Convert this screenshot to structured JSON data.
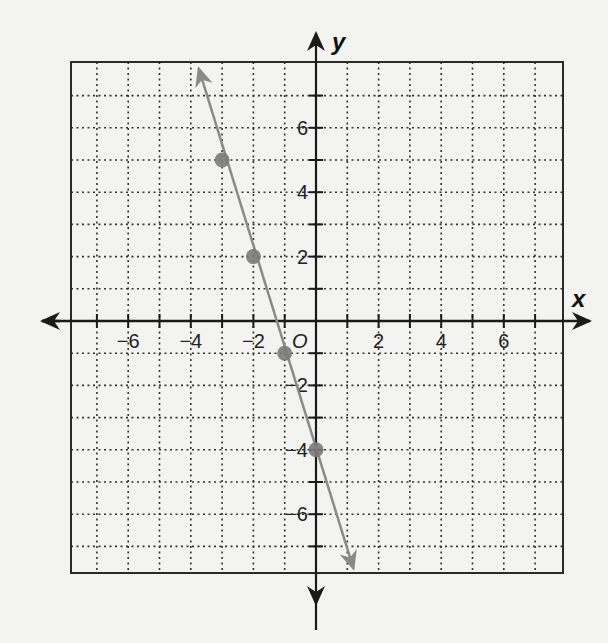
{
  "chart_data": {
    "type": "line",
    "title": "",
    "xlabel": "x",
    "ylabel": "y",
    "origin_label": "O",
    "xlim": [
      -7.5,
      7.5
    ],
    "ylim": [
      -7.9,
      8
    ],
    "grid": true,
    "grid_style": "dotted",
    "x_ticks": [
      -6,
      -4,
      -2,
      2,
      4,
      6
    ],
    "x_tick_labels": [
      "−6",
      "−4",
      "−2",
      "2",
      "4",
      "6"
    ],
    "y_ticks": [
      6,
      4,
      2,
      -2,
      -4,
      -6
    ],
    "y_tick_labels": [
      "6",
      "4",
      "2",
      "−2",
      "−4",
      "−6"
    ],
    "series": [
      {
        "name": "y = -3x - 4",
        "kind": "line-with-arrows",
        "color": "#8a8a8a",
        "endpoints": [
          [
            -3.75,
            7.85
          ],
          [
            1.2,
            -7.7
          ]
        ],
        "points": [
          [
            -3,
            5
          ],
          [
            -2,
            2
          ],
          [
            -1,
            -1
          ],
          [
            0,
            -4
          ]
        ]
      }
    ],
    "legend": null
  },
  "colors": {
    "background": "#f3f3f1",
    "axis": "#1a1a1a",
    "grid": "#333333",
    "line": "#8a8a8a",
    "point": "#7a7a7a"
  }
}
